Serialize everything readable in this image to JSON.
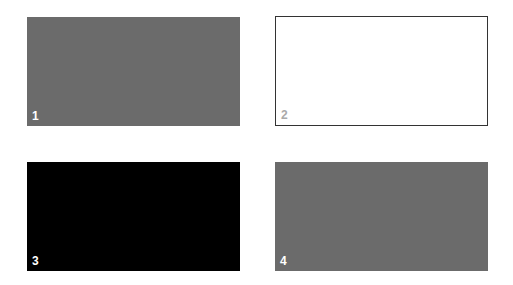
{
  "panels": [
    {
      "label": "1",
      "fill": "#6b6b6b",
      "border": "none",
      "label_color": "#ffffff"
    },
    {
      "label": "2",
      "fill": "#ffffff",
      "border": "#333333",
      "label_color": "#aaaaaa"
    },
    {
      "label": "3",
      "fill": "#000000",
      "border": "none",
      "label_color": "#ffffff"
    },
    {
      "label": "4",
      "fill": "#6b6b6b",
      "border": "none",
      "label_color": "#ffffff"
    }
  ]
}
